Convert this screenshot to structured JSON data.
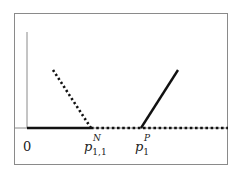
{
  "diagram": {
    "frame": {
      "x": 14,
      "y": 13,
      "width": 214,
      "height": 152,
      "color": "#8a8a8a"
    },
    "axes": {
      "origin": {
        "x": 27,
        "y": 128
      },
      "y_axis_top": 32,
      "x_axis_right": 228,
      "color": "#8a8a8a"
    },
    "lines": [
      {
        "name": "solid-baseline-segment",
        "style": "solid",
        "from": [
          27,
          128
        ],
        "to": [
          91,
          128
        ],
        "color": "#111111",
        "width": 2.4
      },
      {
        "name": "dotted-descending-line",
        "style": "dotted",
        "from": [
          53,
          70
        ],
        "to": [
          91,
          128
        ],
        "color": "#111111",
        "width": 2.6
      },
      {
        "name": "dotted-baseline-segment",
        "style": "dotted",
        "from": [
          91,
          128
        ],
        "to": [
          228,
          128
        ],
        "color": "#111111",
        "width": 2.6
      },
      {
        "name": "solid-ascending-line",
        "style": "solid",
        "from": [
          141,
          128
        ],
        "to": [
          178,
          70
        ],
        "color": "#111111",
        "width": 2.4
      }
    ],
    "labels": {
      "origin": "0",
      "p_n": {
        "base": "p",
        "subscript": "1,1",
        "superscript": "N"
      },
      "p_p": {
        "base": "p",
        "subscript": "1",
        "superscript": "P"
      }
    }
  }
}
